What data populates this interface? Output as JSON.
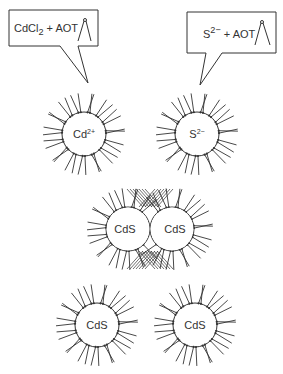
{
  "diagram": {
    "type": "reverse-micelle CdS nanoparticle synthesis",
    "colors": {
      "line": "#333333",
      "background": "#ffffff"
    },
    "callouts": [
      {
        "id": "left",
        "base": "CdCl",
        "sub": "2",
        "suffix": " + AOT",
        "icon": "surfactant-icon"
      },
      {
        "id": "right",
        "base": "S",
        "sup": "2−",
        "suffix": " + AOT",
        "icon": "surfactant-icon"
      }
    ],
    "micelles": [
      {
        "label": "Cd",
        "sup": "2+",
        "cx": 84,
        "cy": 134
      },
      {
        "label": "S",
        "sup": "2−",
        "cx": 197,
        "cy": 134
      },
      {
        "label": "CdS",
        "cx": 128,
        "cy": 229
      },
      {
        "label": "CdS",
        "cx": 172,
        "cy": 229
      },
      {
        "label": "CdS",
        "cx": 97,
        "cy": 325
      },
      {
        "label": "CdS",
        "cx": 195,
        "cy": 325
      }
    ]
  }
}
